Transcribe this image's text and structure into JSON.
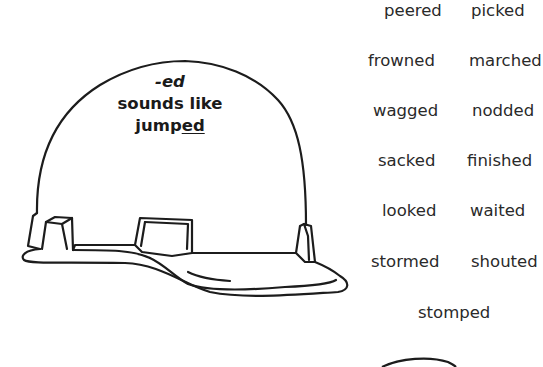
{
  "helmet_label": {
    "line1": "-ed",
    "line2": "sounds like",
    "line3_prefix": "jump",
    "line3_underlined": "ed"
  },
  "words": [
    {
      "text": "peered",
      "x": 384,
      "y": 1
    },
    {
      "text": "picked",
      "x": 471,
      "y": 1
    },
    {
      "text": "frowned",
      "x": 368,
      "y": 51
    },
    {
      "text": "marched",
      "x": 469,
      "y": 51
    },
    {
      "text": "wagged",
      "x": 373,
      "y": 101
    },
    {
      "text": "nodded",
      "x": 472,
      "y": 101
    },
    {
      "text": "sacked",
      "x": 378,
      "y": 151
    },
    {
      "text": "finished",
      "x": 467,
      "y": 151
    },
    {
      "text": "looked",
      "x": 382,
      "y": 201
    },
    {
      "text": "waited",
      "x": 470,
      "y": 201
    },
    {
      "text": "stormed",
      "x": 371,
      "y": 252
    },
    {
      "text": "shouted",
      "x": 471,
      "y": 252
    },
    {
      "text": "stomped",
      "x": 418,
      "y": 303
    }
  ],
  "colors": {
    "ink": "#1c1c1c",
    "background": "#ffffff"
  }
}
